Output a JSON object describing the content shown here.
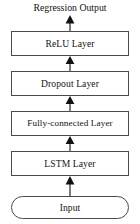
{
  "diagram": {
    "type": "flowchart",
    "orientation": "bottom-to-top",
    "output_label": "Regression Output",
    "nodes": [
      {
        "id": "input",
        "label": "Input",
        "shape": "stadium",
        "order": 1
      },
      {
        "id": "lstm",
        "label": "LSTM Layer",
        "shape": "rectangle",
        "order": 2
      },
      {
        "id": "fc",
        "label": "Fully-connected Layer",
        "shape": "rectangle",
        "order": 3
      },
      {
        "id": "dropout",
        "label": "Dropout Layer",
        "shape": "rectangle",
        "order": 4
      },
      {
        "id": "relu",
        "label": "ReLU Layer",
        "shape": "rectangle",
        "order": 5
      },
      {
        "id": "output",
        "label": "Regression Output",
        "shape": "text",
        "order": 6
      }
    ],
    "edges": [
      {
        "id": "a-lstm",
        "from": "input",
        "to": "lstm",
        "arrowhead": "solid-triangle"
      },
      {
        "id": "a-fc",
        "from": "lstm",
        "to": "fc",
        "arrowhead": "solid-triangle"
      },
      {
        "id": "a-dropout",
        "from": "fc",
        "to": "dropout",
        "arrowhead": "solid-triangle"
      },
      {
        "id": "a-relu",
        "from": "dropout",
        "to": "relu",
        "arrowhead": "solid-triangle"
      },
      {
        "id": "a-top",
        "from": "relu",
        "to": "output",
        "arrowhead": "solid-triangle"
      }
    ],
    "colors": {
      "stroke": "#4a4a4a",
      "arrow": "#111111",
      "text": "#141414",
      "background": "#ffffff"
    }
  }
}
